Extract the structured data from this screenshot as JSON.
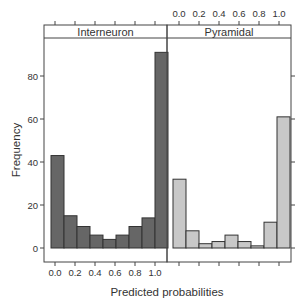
{
  "chart_data": {
    "type": "bar",
    "subtype": "histogram (lattice panels)",
    "xlabel": "Predicted probabilities",
    "ylabel": "Frequency",
    "xlim": [
      0.0,
      1.0
    ],
    "ylim": [
      0,
      95
    ],
    "x_ticks": [
      "0.0",
      "0.2",
      "0.4",
      "0.6",
      "0.8",
      "1.0"
    ],
    "y_ticks": [
      "0",
      "20",
      "40",
      "60",
      "80"
    ],
    "bins": 9,
    "grid": false,
    "legend": null,
    "panels": [
      {
        "name": "Interneuron",
        "fill": "#666666",
        "values": [
          43,
          15,
          10,
          6,
          4,
          6,
          10,
          14,
          91
        ]
      },
      {
        "name": "Pyramidal",
        "fill": "#c8c8c8",
        "values": [
          32,
          8,
          2,
          3,
          6,
          3,
          1,
          12,
          61
        ]
      }
    ]
  },
  "colors": {
    "stroke": "#333333",
    "frame": "#444444",
    "strip_bg": "#ffffff"
  }
}
